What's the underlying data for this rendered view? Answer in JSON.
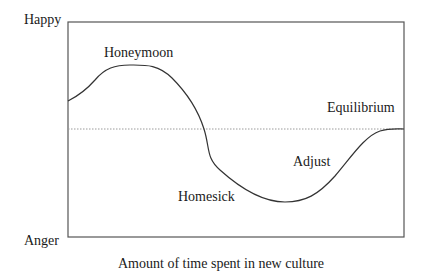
{
  "diagram": {
    "type": "culture-shock-curve",
    "y_axis": {
      "top_label": "Happy",
      "bottom_label": "Anger"
    },
    "x_axis": {
      "label": "Amount of time spent in new culture"
    },
    "baseline": {
      "style": "dotted"
    },
    "stages": [
      {
        "label": "Honeymoon"
      },
      {
        "label": "Homesick"
      },
      {
        "label": "Adjust"
      },
      {
        "label": "Equilibrium"
      }
    ],
    "colors": {
      "line": "#333333",
      "frame": "#555555",
      "baseline": "#9a9a9a",
      "text": "#1a1a1a"
    }
  }
}
